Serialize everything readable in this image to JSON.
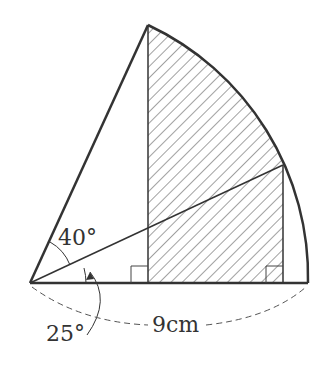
{
  "figure": {
    "angle_top_label": "40°",
    "angle_bottom_label": "25°",
    "radius_label": "9cm",
    "angle_top_deg": 40,
    "angle_bottom_deg": 25,
    "radius_cm": 9,
    "shaded": true,
    "stroke_color": "#333333"
  }
}
